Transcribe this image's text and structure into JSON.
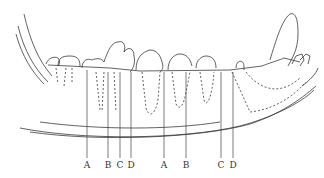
{
  "figure": {
    "ink_color": "#3a3a3a",
    "labels": [
      {
        "text": "A",
        "x": 87
      },
      {
        "text": "B",
        "x": 108
      },
      {
        "text": "C",
        "x": 120
      },
      {
        "text": "D",
        "x": 131
      },
      {
        "text": "A",
        "x": 164
      },
      {
        "text": "B",
        "x": 186
      },
      {
        "text": "C",
        "x": 221
      },
      {
        "text": "D",
        "x": 233
      }
    ]
  }
}
